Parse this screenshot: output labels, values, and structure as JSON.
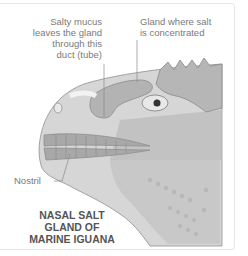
{
  "diagram": {
    "title_lines": [
      "NASAL SALT",
      "GLAND OF",
      "MARINE IGUANA"
    ],
    "labels": {
      "duct": [
        "Salty mucus",
        "leaves the gland",
        "through this",
        "duct (tube)"
      ],
      "gland": [
        "Gland where salt",
        "is concentrated"
      ],
      "nostril": "Nostril"
    },
    "colors": {
      "skin": "#c9c9c9",
      "skin_light": "#dcdcdc",
      "scale_dark": "#a9a9a9",
      "gland": "#b3b3b3",
      "line": "#8a8a8a",
      "text": "#7a7a7a"
    }
  }
}
